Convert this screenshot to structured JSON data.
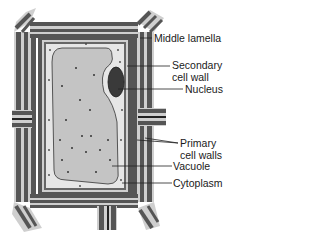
{
  "diagram": {
    "colors": {
      "wall_dark": "#555555",
      "wall_light": "#cfcfcf",
      "wall_line": "#222222",
      "cytoplasm": "#e6e6e6",
      "vacuole": "#c4c4c4",
      "nucleus": "#3a3a3a",
      "leader": "#222222"
    },
    "labels": [
      {
        "id": "middle-lamella",
        "lines": [
          "Middle lamella"
        ]
      },
      {
        "id": "secondary-cell-wall",
        "lines": [
          "Secondary",
          "cell wall"
        ]
      },
      {
        "id": "nucleus",
        "lines": [
          "Nucleus"
        ]
      },
      {
        "id": "primary-cell-walls",
        "lines": [
          "Primary",
          "cell walls"
        ]
      },
      {
        "id": "vacuole",
        "lines": [
          "Vacuole"
        ]
      },
      {
        "id": "cytoplasm",
        "lines": [
          "Cytoplasm"
        ]
      }
    ]
  }
}
